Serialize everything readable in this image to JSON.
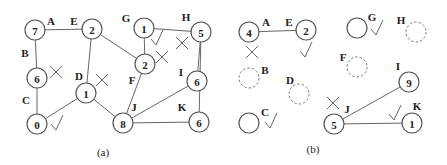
{
  "panel_a": {
    "caption": "(a)",
    "nodes": [
      {
        "id": "A",
        "value": "7",
        "x": 35,
        "y": 30,
        "lx": 51,
        "ly": 21
      },
      {
        "id": "E",
        "value": "2",
        "x": 92,
        "y": 29,
        "lx": 74,
        "ly": 21
      },
      {
        "id": "B",
        "value": "6",
        "x": 37,
        "y": 78,
        "lx": 25,
        "ly": 53
      },
      {
        "id": "C",
        "value": "0",
        "x": 37,
        "y": 124,
        "lx": 26,
        "ly": 100
      },
      {
        "id": "D",
        "value": "1",
        "x": 86,
        "y": 93,
        "lx": 79,
        "ly": 76
      },
      {
        "id": "F",
        "value": "2",
        "x": 145,
        "y": 64,
        "lx": 132,
        "ly": 80
      },
      {
        "id": "G",
        "value": "1",
        "x": 144,
        "y": 28,
        "lx": 126,
        "ly": 18
      },
      {
        "id": "H",
        "value": "5",
        "x": 201,
        "y": 32,
        "lx": 186,
        "ly": 17
      },
      {
        "id": "I",
        "value": "6",
        "x": 197,
        "y": 81,
        "lx": 181,
        "ly": 72
      },
      {
        "id": "J",
        "value": "8",
        "x": 123,
        "y": 123,
        "lx": 134,
        "ly": 107
      },
      {
        "id": "K",
        "value": "6",
        "x": 199,
        "y": 122,
        "lx": 182,
        "ly": 107
      }
    ],
    "edges": [
      [
        "A",
        "E"
      ],
      [
        "A",
        "B"
      ],
      [
        "B",
        "C"
      ],
      [
        "E",
        "D"
      ],
      [
        "E",
        "F"
      ],
      [
        "D",
        "C"
      ],
      [
        "D",
        "J"
      ],
      [
        "G",
        "F"
      ],
      [
        "G",
        "H"
      ],
      [
        "F",
        "J"
      ],
      [
        "H",
        "I"
      ],
      [
        "I",
        "J"
      ],
      [
        "J",
        "K"
      ],
      [
        "H",
        "K"
      ]
    ],
    "marks": [
      {
        "type": "cross",
        "x": 56,
        "y": 72
      },
      {
        "type": "cross",
        "x": 102,
        "y": 80
      },
      {
        "type": "check",
        "x": 57,
        "y": 124
      },
      {
        "type": "check",
        "x": 157,
        "y": 39
      },
      {
        "type": "cross",
        "x": 162,
        "y": 57
      },
      {
        "type": "cross",
        "x": 182,
        "y": 43
      }
    ]
  },
  "panel_b": {
    "caption": "(b)",
    "nodes": [
      {
        "id": "A",
        "value": "4",
        "x": 249,
        "y": 32,
        "style": "solid",
        "lx": 266,
        "ly": 22
      },
      {
        "id": "E",
        "value": "2",
        "x": 306,
        "y": 30,
        "style": "solid",
        "lx": 289,
        "ly": 22
      },
      {
        "id": "G",
        "value": "",
        "x": 357,
        "y": 28,
        "style": "solid",
        "lx": 372,
        "ly": 17
      },
      {
        "id": "H",
        "value": "",
        "x": 416,
        "y": 32,
        "style": "dashed",
        "lx": 401,
        "ly": 20
      },
      {
        "id": "B",
        "value": "",
        "x": 249,
        "y": 78,
        "style": "dashed",
        "lx": 265,
        "ly": 70
      },
      {
        "id": "F",
        "value": "",
        "x": 357,
        "y": 67,
        "style": "dashed",
        "lx": 343,
        "ly": 57
      },
      {
        "id": "D",
        "value": "",
        "x": 299,
        "y": 94,
        "style": "dashed",
        "lx": 290,
        "ly": 80
      },
      {
        "id": "I",
        "value": "9",
        "x": 409,
        "y": 82,
        "style": "solid",
        "lx": 398,
        "ly": 66
      },
      {
        "id": "C",
        "value": "",
        "x": 249,
        "y": 123,
        "style": "solid",
        "lx": 265,
        "ly": 112
      },
      {
        "id": "J",
        "value": "5",
        "x": 334,
        "y": 124,
        "style": "solid",
        "lx": 347,
        "ly": 109
      },
      {
        "id": "K",
        "value": "1",
        "x": 412,
        "y": 123,
        "style": "solid",
        "lx": 417,
        "ly": 106
      }
    ],
    "edges": [
      [
        "A",
        "E"
      ],
      [
        "J",
        "I"
      ],
      [
        "J",
        "K"
      ]
    ],
    "marks": [
      {
        "type": "cross",
        "x": 252,
        "y": 52
      },
      {
        "type": "check",
        "x": 306,
        "y": 51
      },
      {
        "type": "check",
        "x": 377,
        "y": 29
      },
      {
        "type": "check",
        "x": 271,
        "y": 122
      },
      {
        "type": "cross",
        "x": 333,
        "y": 103
      },
      {
        "type": "check",
        "x": 395,
        "y": 114
      }
    ]
  }
}
